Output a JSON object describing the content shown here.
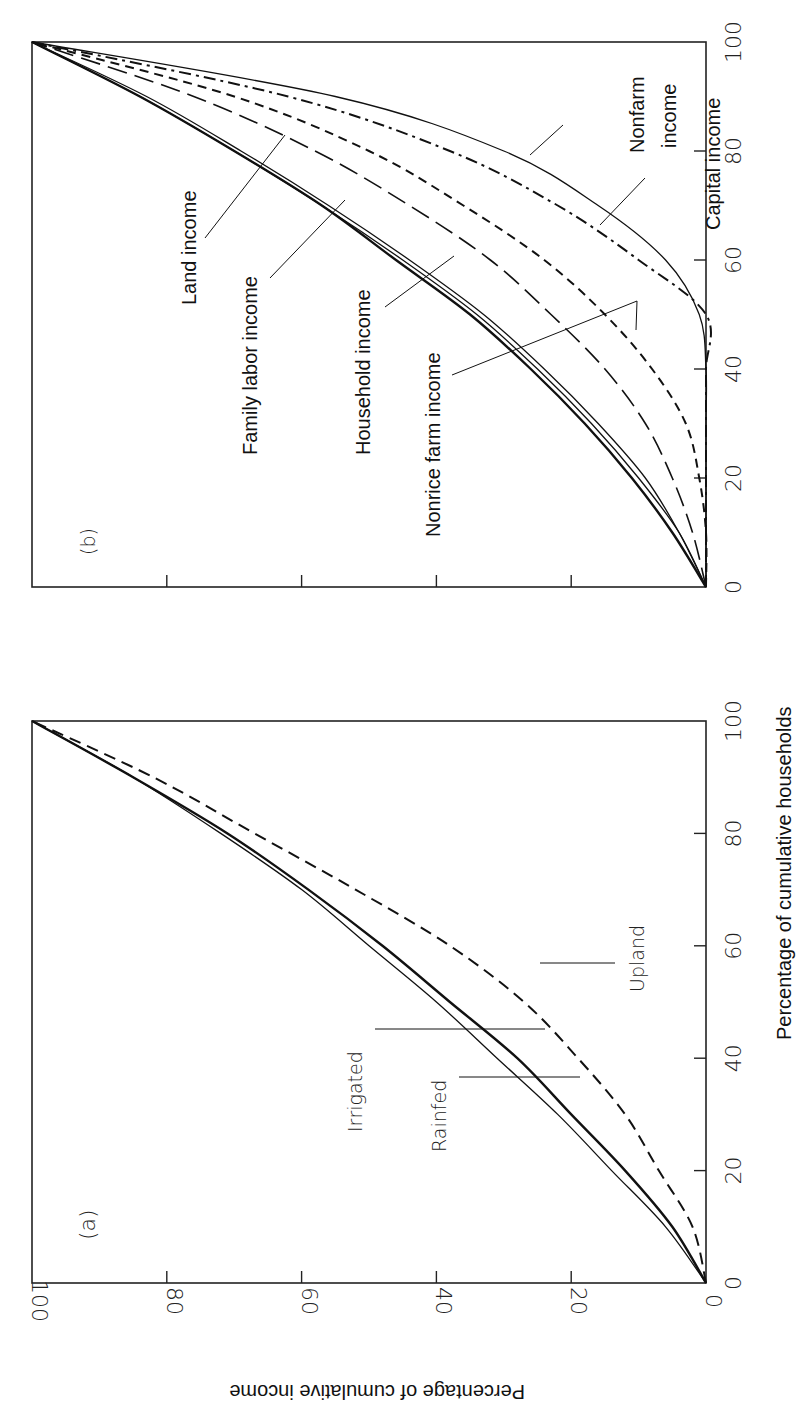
{
  "chart_data": [
    {
      "panel": "(a)",
      "type": "line",
      "title": "",
      "xlabel": "Percentage of cumulative households",
      "ylabel": "Percentage of cumulative income",
      "xlim": [
        0,
        100
      ],
      "ylim": [
        0,
        100
      ],
      "xticks": [
        "0",
        "20",
        "40",
        "60",
        "80",
        "100"
      ],
      "yticks": [
        "0",
        "20",
        "40",
        "60",
        "80",
        "100"
      ],
      "grid": false,
      "orientation": "rotated 90° counter-clockwise",
      "x": [
        0,
        10,
        20,
        30,
        40,
        50,
        60,
        70,
        80,
        90,
        100
      ],
      "series": [
        {
          "name": "Irrigated",
          "style": "solid-thick",
          "values": [
            0,
            5,
            12,
            20,
            28,
            38,
            48,
            59,
            71,
            85,
            100
          ]
        },
        {
          "name": "Rainfed",
          "style": "solid-thin",
          "values": [
            0,
            6,
            14,
            22,
            31,
            40,
            50,
            60,
            72,
            85,
            100
          ]
        },
        {
          "name": "Upland",
          "style": "dashed",
          "values": [
            0,
            2,
            7,
            12,
            19,
            27,
            38,
            52,
            67,
            82,
            100
          ]
        }
      ]
    },
    {
      "panel": "(b)",
      "type": "line",
      "title": "",
      "xlabel": "Percentage of cumulative households",
      "ylabel": "Percentage of cumulative income",
      "xlim": [
        0,
        100
      ],
      "ylim": [
        0,
        100
      ],
      "xticks": [
        "0",
        "20",
        "40",
        "60",
        "80",
        "100"
      ],
      "yticks": [
        "0",
        "20",
        "40",
        "60",
        "80",
        "100"
      ],
      "grid": false,
      "orientation": "rotated 90° counter-clockwise",
      "x": [
        0,
        10,
        20,
        30,
        40,
        50,
        60,
        70,
        80,
        90,
        100
      ],
      "series": [
        {
          "name": "Household income",
          "style": "solid-thick",
          "values": [
            0,
            5,
            11,
            18,
            26,
            35,
            46,
            57,
            70,
            84,
            100
          ]
        },
        {
          "name": "Family labor income",
          "style": "solid-thin",
          "values": [
            0,
            4,
            10,
            17,
            25,
            34,
            45,
            57,
            70,
            84,
            100
          ]
        },
        {
          "name": "Land income",
          "style": "solid-thin",
          "values": [
            0,
            4,
            9,
            16,
            24,
            33,
            44,
            56,
            69,
            83,
            100
          ]
        },
        {
          "name": "Nonrice farm income",
          "style": "long-dash",
          "values": [
            0,
            2,
            5,
            9,
            15,
            23,
            32,
            44,
            58,
            76,
            100
          ]
        },
        {
          "name": "Capital income",
          "style": "dash-dot",
          "values": [
            0,
            0,
            0,
            0,
            0,
            0,
            10,
            22,
            38,
            62,
            100
          ]
        },
        {
          "name": "(unlabeled short-dash)",
          "style": "short-dash",
          "values": [
            0,
            0,
            1,
            3,
            8,
            15,
            24,
            36,
            50,
            70,
            100
          ]
        },
        {
          "name": "Nonfarm income",
          "style": "solid-thin",
          "values": [
            0,
            0,
            0,
            0,
            0,
            1,
            6,
            16,
            30,
            55,
            100
          ]
        }
      ]
    }
  ],
  "panels": {
    "a": {
      "tag": "(a)",
      "labels": {
        "irrigated": "Irrigated",
        "rainfed": "Rainfed",
        "upland": "Upland"
      }
    },
    "b": {
      "tag": "(b)",
      "labels": {
        "land": "Land income",
        "family": "Family labor income",
        "household": "Household income",
        "nonrice": "Nonrice farm income",
        "nonfarm1": "Nonfarm",
        "nonfarm2": "income",
        "capital": "Capital income"
      }
    }
  },
  "axes": {
    "xlabel": "Percentage of cumulative households",
    "ylabel": "Percentage of cumulative income",
    "ticks": [
      "0",
      "20",
      "40",
      "60",
      "80",
      "100"
    ]
  }
}
